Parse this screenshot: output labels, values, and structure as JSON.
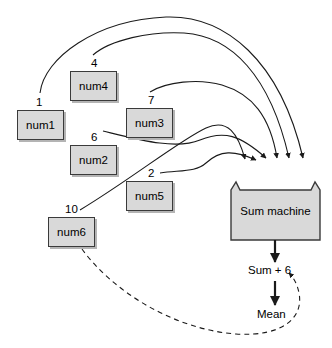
{
  "diagram": {
    "background_color": "#ffffff",
    "box_fill_color": "#d9d9d9",
    "box_border_color": "#3a3a3a",
    "line_color": "#1a1a1a",
    "variables": [
      {
        "name": "num1",
        "value": "1",
        "box_x": 17,
        "box_y": 110,
        "box_w": 47,
        "box_h": 30,
        "label_x": 36,
        "label_y": 96
      },
      {
        "name": "num4",
        "value": "4",
        "box_x": 70,
        "box_y": 71,
        "box_w": 47,
        "box_h": 30,
        "label_x": 91,
        "label_y": 57
      },
      {
        "name": "num3",
        "value": "7",
        "box_x": 126,
        "box_y": 108,
        "box_w": 47,
        "box_h": 30,
        "label_x": 148,
        "label_y": 94
      },
      {
        "name": "num2",
        "value": "6",
        "box_x": 70,
        "box_y": 145,
        "box_w": 47,
        "box_h": 30,
        "label_x": 91,
        "label_y": 131
      },
      {
        "name": "num5",
        "value": "2",
        "box_x": 126,
        "box_y": 181,
        "box_w": 47,
        "box_h": 30,
        "label_x": 148,
        "label_y": 167
      },
      {
        "name": "num6",
        "value": "10",
        "box_x": 48,
        "box_y": 217,
        "box_w": 47,
        "box_h": 30,
        "label_x": 65,
        "label_y": 203
      }
    ],
    "machine": {
      "label": "Sum machine",
      "x": 231,
      "y": 182,
      "w": 89,
      "h": 58,
      "input_arrow_count": 6
    },
    "outputs": {
      "sum_label": "Sum + 6",
      "sum_label_x": 248,
      "sum_label_y": 272,
      "mean_label": "Mean",
      "mean_label_x": 257,
      "mean_label_y": 316
    },
    "feedback": {
      "from": "num6",
      "to": "Sum + 6",
      "style": "dashed"
    }
  }
}
